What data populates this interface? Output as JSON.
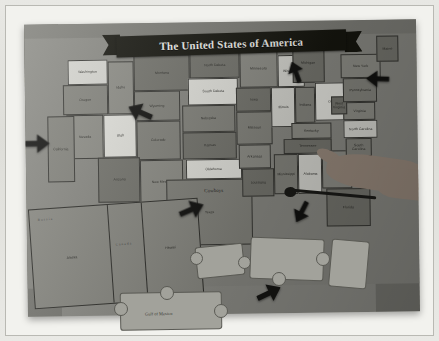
{
  "photo": {
    "subject": "Physical jigsaw puzzle map of the United States on a white table",
    "title_banner": "The United States of America"
  },
  "map": {
    "title": "The United States of America",
    "regions": {
      "canada": "Canada",
      "mexico": "MEXICO",
      "gulf_of_mexico": "Gulf of Mexico",
      "russia": "Russia",
      "pacific_ocean": "Pacific Ocean",
      "atlantic_ocean": "Atlantic Ocean"
    },
    "annotation_sticker": "Cowboys",
    "states": [
      {
        "name": "Washington",
        "capital": "Olympia",
        "tone": "light"
      },
      {
        "name": "Oregon",
        "capital": "Salem",
        "tone": "mid"
      },
      {
        "name": "Idaho",
        "capital": "Boise",
        "tone": "mid2"
      },
      {
        "name": "Montana",
        "capital": "Helena",
        "tone": "dark"
      },
      {
        "name": "Wyoming",
        "capital": "Cheyenne",
        "tone": "mid"
      },
      {
        "name": "Nevada",
        "capital": "Carson City",
        "tone": "mid2"
      },
      {
        "name": "California",
        "capital": "Sacramento",
        "tone": "mid"
      },
      {
        "name": "Utah",
        "capital": "Salt Lake City",
        "tone": "vlight"
      },
      {
        "name": "Colorado",
        "capital": "Denver",
        "tone": "mid"
      },
      {
        "name": "Arizona",
        "capital": "Phoenix",
        "tone": "dark"
      },
      {
        "name": "New Mexico",
        "capital": "Santa Fe",
        "tone": "mid2"
      },
      {
        "name": "North Dakota",
        "capital": "Bismarck",
        "tone": "dark"
      },
      {
        "name": "South Dakota",
        "capital": "Pierre",
        "tone": "vlight"
      },
      {
        "name": "Nebraska",
        "capital": "Lincoln",
        "tone": "mid"
      },
      {
        "name": "Kansas",
        "capital": "Topeka",
        "tone": "dark"
      },
      {
        "name": "Oklahoma",
        "capital": "Oklahoma City",
        "tone": "vlight"
      },
      {
        "name": "Texas",
        "capital": "Austin",
        "tone": "mid"
      },
      {
        "name": "Minnesota",
        "capital": "Saint Paul",
        "tone": "mid2"
      },
      {
        "name": "Iowa",
        "capital": "Des Moines",
        "tone": "dark"
      },
      {
        "name": "Missouri",
        "capital": "Jefferson City",
        "tone": "mid"
      },
      {
        "name": "Arkansas",
        "capital": "Little Rock",
        "tone": "mid2"
      },
      {
        "name": "Louisiana",
        "capital": "Baton Rouge",
        "tone": "dark"
      },
      {
        "name": "Wisconsin",
        "capital": "Madison",
        "tone": "light"
      },
      {
        "name": "Illinois",
        "capital": "Springfield",
        "tone": "light"
      },
      {
        "name": "Michigan",
        "capital": "Lansing",
        "tone": "dark"
      },
      {
        "name": "Indiana",
        "capital": "Indianapolis",
        "tone": "mid"
      },
      {
        "name": "Ohio",
        "capital": "Columbus",
        "tone": "vlight"
      },
      {
        "name": "Kentucky",
        "capital": "Frankfort",
        "tone": "mid2"
      },
      {
        "name": "Tennessee",
        "capital": "Nashville",
        "tone": "dark"
      },
      {
        "name": "Mississippi",
        "capital": "Jackson",
        "tone": "mid"
      },
      {
        "name": "Alabama",
        "capital": "Montgomery",
        "tone": "light"
      },
      {
        "name": "Georgia",
        "capital": "Atlanta",
        "tone": "mid2"
      },
      {
        "name": "Florida",
        "capital": "Tallahassee",
        "tone": "dark"
      },
      {
        "name": "South Carolina",
        "capital": "Columbia",
        "tone": "mid"
      },
      {
        "name": "North Carolina",
        "capital": "Raleigh",
        "tone": "light"
      },
      {
        "name": "Virginia",
        "capital": "Richmond",
        "tone": "mid2"
      },
      {
        "name": "West Virginia",
        "capital": "Charleston",
        "tone": "dark"
      },
      {
        "name": "Pennsylvania",
        "capital": "Harrisburg",
        "tone": "mid"
      },
      {
        "name": "New York",
        "capital": "Albany",
        "tone": "mid2"
      },
      {
        "name": "Maine",
        "capital": "Augusta",
        "tone": "dark"
      },
      {
        "name": "Alaska",
        "capital": "Juneau",
        "tone": "mid"
      },
      {
        "name": "Hawaii",
        "capital": "Honolulu",
        "tone": "mid2"
      }
    ]
  },
  "annotations": {
    "arrow_count": 7,
    "arrows": [
      {
        "id": "arrow-california-coast",
        "points_to": "California coast",
        "direction": "right"
      },
      {
        "id": "arrow-wyoming",
        "points_to": "Wyoming",
        "direction": "down-left"
      },
      {
        "id": "arrow-michigan",
        "points_to": "Michigan",
        "direction": "down"
      },
      {
        "id": "arrow-new-england",
        "points_to": "New England coast",
        "direction": "left"
      },
      {
        "id": "arrow-texas",
        "points_to": "Texas",
        "direction": "up-right"
      },
      {
        "id": "arrow-alabama",
        "points_to": "Alabama",
        "direction": "down-right"
      },
      {
        "id": "arrow-gulf-piece",
        "points_to": "Gulf puzzle piece",
        "direction": "up-right"
      }
    ]
  },
  "objects": {
    "hand": "human hand pointing at the map",
    "cord": "dark cable lying across the map",
    "loose_pieces": "detached jigsaw puzzle pieces below the board"
  }
}
